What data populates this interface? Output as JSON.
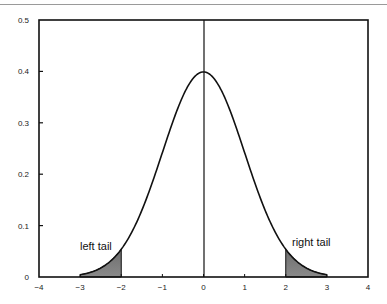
{
  "chart_data": {
    "type": "line",
    "title": "",
    "xlabel": "",
    "ylabel": "",
    "xlim": [
      -4,
      4
    ],
    "ylim": [
      0,
      0.5
    ],
    "grid": false,
    "legend": null,
    "x_ticks": [
      -4,
      -3,
      -2,
      -1,
      0,
      1,
      2,
      3,
      4
    ],
    "x_tick_labels": [
      "−4",
      "−3",
      "−2",
      "−1",
      "0",
      "1",
      "2",
      "3",
      "4"
    ],
    "y_ticks": [
      0,
      0.1,
      0.2,
      0.3,
      0.4,
      0.5
    ],
    "y_tick_labels": [
      "0",
      "0.1",
      "0.2",
      "0.3",
      "0.4",
      "0.5"
    ],
    "series": [
      {
        "name": "standard normal density",
        "x": [
          -3,
          -2.5,
          -2,
          -1.5,
          -1,
          -0.5,
          0,
          0.5,
          1,
          1.5,
          2,
          2.5,
          3
        ],
        "values": [
          0.0044,
          0.0175,
          0.054,
          0.1295,
          0.242,
          0.3521,
          0.3989,
          0.3521,
          0.242,
          0.1295,
          0.054,
          0.0175,
          0.0044
        ]
      }
    ],
    "shaded_regions": [
      {
        "name": "left tail",
        "x_from": -3,
        "x_to": -2,
        "color": "#7a7a7a"
      },
      {
        "name": "right tail",
        "x_from": 2,
        "x_to": 3,
        "color": "#7a7a7a"
      }
    ],
    "annotations": [
      {
        "text": "left tail",
        "x": -2.6,
        "y": 0.065
      },
      {
        "text": "right tail",
        "x": 2.6,
        "y": 0.065
      }
    ],
    "vertical_line": {
      "x": 0
    }
  },
  "labels": {
    "left_tail": "left tail",
    "right_tail": "right tail"
  }
}
